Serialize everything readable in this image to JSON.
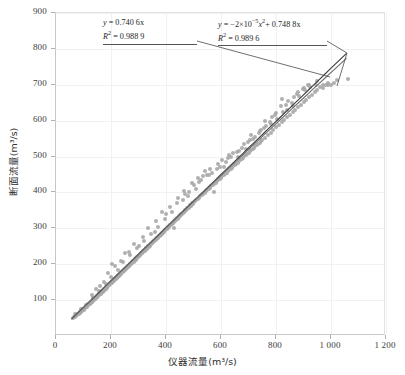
{
  "chart_data": {
    "type": "scatter",
    "title": "",
    "xlabel": "仪器流量(m³/s)",
    "ylabel": "断面流量(m³/s)",
    "xlim": [
      0,
      1200
    ],
    "ylim": [
      0,
      900
    ],
    "xticks": [
      0,
      200,
      400,
      600,
      800,
      1000,
      1200
    ],
    "xticklabels": [
      "0",
      "200",
      "400",
      "600",
      "800",
      "1 000",
      "1 200"
    ],
    "yticks": [
      100,
      200,
      300,
      400,
      500,
      600,
      700,
      800,
      900
    ],
    "yticklabels": [
      "100",
      "200",
      "300",
      "400",
      "500",
      "600",
      "700",
      "800",
      "900"
    ],
    "grid": true,
    "legend": "none",
    "point_color": "#a9a9a9",
    "line_color": "#3a3a3a",
    "annotations": [
      {
        "id": "linear-fit",
        "equation_prefix": "y",
        "equation_body": " = 0.740 6x",
        "r2_label": "R",
        "r2_sup": "2",
        "r2_value": " = 0.988 9"
      },
      {
        "id": "quadratic-fit",
        "equation_prefix": "y",
        "equation_body_a": " = −2×10",
        "equation_sup_a": "−5",
        "equation_body_b": "x",
        "equation_sup_b": "2",
        "equation_body_c": "+ 0.748 8x",
        "r2_label": "R",
        "r2_sup": "2",
        "r2_value": " = 0.989 6"
      }
    ],
    "fit_lines": [
      {
        "name": "linear",
        "slope": 0.7406,
        "intercept": 0,
        "r2": 0.9889,
        "x_range": [
          60,
          1060
        ]
      },
      {
        "name": "quadratic",
        "a": -2e-05,
        "b": 0.7488,
        "c": 0,
        "r2": 0.9896,
        "x_range": [
          60,
          1060
        ]
      }
    ],
    "points": [
      [
        62,
        50
      ],
      [
        66,
        52
      ],
      [
        68,
        55
      ],
      [
        70,
        54
      ],
      [
        72,
        58
      ],
      [
        74,
        57
      ],
      [
        76,
        60
      ],
      [
        78,
        59
      ],
      [
        80,
        62
      ],
      [
        82,
        61
      ],
      [
        84,
        64
      ],
      [
        86,
        66
      ],
      [
        88,
        65
      ],
      [
        90,
        68
      ],
      [
        92,
        70
      ],
      [
        94,
        69
      ],
      [
        96,
        72
      ],
      [
        98,
        74
      ],
      [
        100,
        73
      ],
      [
        102,
        76
      ],
      [
        104,
        78
      ],
      [
        106,
        77
      ],
      [
        108,
        80
      ],
      [
        110,
        82
      ],
      [
        112,
        81
      ],
      [
        114,
        84
      ],
      [
        116,
        86
      ],
      [
        118,
        85
      ],
      [
        120,
        88
      ],
      [
        122,
        90
      ],
      [
        124,
        89
      ],
      [
        126,
        92
      ],
      [
        128,
        94
      ],
      [
        130,
        96
      ],
      [
        132,
        95
      ],
      [
        134,
        98
      ],
      [
        136,
        100
      ],
      [
        138,
        99
      ],
      [
        140,
        102
      ],
      [
        142,
        104
      ],
      [
        144,
        106
      ],
      [
        146,
        105
      ],
      [
        148,
        108
      ],
      [
        150,
        110
      ],
      [
        152,
        112
      ],
      [
        154,
        111
      ],
      [
        156,
        114
      ],
      [
        158,
        116
      ],
      [
        160,
        118
      ],
      [
        162,
        117
      ],
      [
        164,
        120
      ],
      [
        166,
        122
      ],
      [
        168,
        124
      ],
      [
        170,
        123
      ],
      [
        172,
        126
      ],
      [
        174,
        128
      ],
      [
        176,
        130
      ],
      [
        178,
        129
      ],
      [
        180,
        132
      ],
      [
        182,
        134
      ],
      [
        184,
        136
      ],
      [
        186,
        135
      ],
      [
        188,
        138
      ],
      [
        190,
        140
      ],
      [
        192,
        142
      ],
      [
        194,
        141
      ],
      [
        196,
        144
      ],
      [
        198,
        146
      ],
      [
        200,
        148
      ],
      [
        202,
        147
      ],
      [
        204,
        150
      ],
      [
        206,
        152
      ],
      [
        208,
        154
      ],
      [
        210,
        153
      ],
      [
        212,
        156
      ],
      [
        214,
        158
      ],
      [
        216,
        160
      ],
      [
        218,
        159
      ],
      [
        220,
        162
      ],
      [
        222,
        164
      ],
      [
        224,
        166
      ],
      [
        226,
        165
      ],
      [
        228,
        168
      ],
      [
        230,
        170
      ],
      [
        232,
        172
      ],
      [
        234,
        171
      ],
      [
        236,
        174
      ],
      [
        238,
        176
      ],
      [
        240,
        178
      ],
      [
        242,
        177
      ],
      [
        244,
        180
      ],
      [
        246,
        182
      ],
      [
        248,
        184
      ],
      [
        250,
        183
      ],
      [
        252,
        186
      ],
      [
        254,
        188
      ],
      [
        256,
        190
      ],
      [
        258,
        189
      ],
      [
        260,
        192
      ],
      [
        262,
        194
      ],
      [
        264,
        196
      ],
      [
        266,
        195
      ],
      [
        268,
        198
      ],
      [
        270,
        200
      ],
      [
        272,
        202
      ],
      [
        274,
        201
      ],
      [
        276,
        204
      ],
      [
        278,
        206
      ],
      [
        280,
        208
      ],
      [
        282,
        207
      ],
      [
        284,
        210
      ],
      [
        286,
        212
      ],
      [
        288,
        214
      ],
      [
        290,
        213
      ],
      [
        292,
        216
      ],
      [
        294,
        218
      ],
      [
        296,
        220
      ],
      [
        298,
        219
      ],
      [
        300,
        222
      ],
      [
        302,
        224
      ],
      [
        304,
        226
      ],
      [
        306,
        225
      ],
      [
        308,
        228
      ],
      [
        310,
        230
      ],
      [
        312,
        232
      ],
      [
        314,
        231
      ],
      [
        316,
        234
      ],
      [
        318,
        236
      ],
      [
        320,
        238
      ],
      [
        322,
        237
      ],
      [
        324,
        240
      ],
      [
        326,
        242
      ],
      [
        328,
        244
      ],
      [
        330,
        243
      ],
      [
        332,
        246
      ],
      [
        334,
        248
      ],
      [
        336,
        250
      ],
      [
        338,
        249
      ],
      [
        340,
        252
      ],
      [
        342,
        254
      ],
      [
        344,
        256
      ],
      [
        346,
        255
      ],
      [
        348,
        258
      ],
      [
        350,
        260
      ],
      [
        352,
        262
      ],
      [
        354,
        261
      ],
      [
        356,
        264
      ],
      [
        358,
        266
      ],
      [
        360,
        268
      ],
      [
        362,
        267
      ],
      [
        364,
        270
      ],
      [
        366,
        272
      ],
      [
        368,
        274
      ],
      [
        370,
        273
      ],
      [
        372,
        276
      ],
      [
        374,
        278
      ],
      [
        376,
        280
      ],
      [
        378,
        279
      ],
      [
        380,
        282
      ],
      [
        382,
        284
      ],
      [
        384,
        286
      ],
      [
        386,
        285
      ],
      [
        388,
        288
      ],
      [
        390,
        290
      ],
      [
        392,
        292
      ],
      [
        394,
        291
      ],
      [
        396,
        294
      ],
      [
        398,
        296
      ],
      [
        400,
        298
      ],
      [
        402,
        297
      ],
      [
        404,
        300
      ],
      [
        406,
        302
      ],
      [
        408,
        304
      ],
      [
        410,
        303
      ],
      [
        412,
        306
      ],
      [
        414,
        308
      ],
      [
        416,
        310
      ],
      [
        418,
        309
      ],
      [
        420,
        312
      ],
      [
        422,
        314
      ],
      [
        424,
        316
      ],
      [
        426,
        315
      ],
      [
        428,
        318
      ],
      [
        430,
        320
      ],
      [
        432,
        322
      ],
      [
        434,
        321
      ],
      [
        436,
        324
      ],
      [
        438,
        326
      ],
      [
        440,
        328
      ],
      [
        442,
        327
      ],
      [
        444,
        330
      ],
      [
        446,
        332
      ],
      [
        448,
        334
      ],
      [
        450,
        333
      ],
      [
        452,
        336
      ],
      [
        454,
        338
      ],
      [
        456,
        340
      ],
      [
        458,
        339
      ],
      [
        460,
        342
      ],
      [
        462,
        344
      ],
      [
        464,
        346
      ],
      [
        466,
        345
      ],
      [
        468,
        348
      ],
      [
        470,
        350
      ],
      [
        472,
        352
      ],
      [
        474,
        351
      ],
      [
        476,
        354
      ],
      [
        478,
        356
      ],
      [
        480,
        358
      ],
      [
        482,
        357
      ],
      [
        484,
        360
      ],
      [
        486,
        362
      ],
      [
        488,
        364
      ],
      [
        490,
        363
      ],
      [
        492,
        366
      ],
      [
        494,
        368
      ],
      [
        496,
        370
      ],
      [
        498,
        369
      ],
      [
        500,
        372
      ],
      [
        505,
        375
      ],
      [
        510,
        378
      ],
      [
        515,
        382
      ],
      [
        520,
        385
      ],
      [
        525,
        389
      ],
      [
        530,
        392
      ],
      [
        535,
        396
      ],
      [
        540,
        399
      ],
      [
        545,
        403
      ],
      [
        550,
        406
      ],
      [
        555,
        410
      ],
      [
        560,
        413
      ],
      [
        565,
        417
      ],
      [
        570,
        420
      ],
      [
        575,
        424
      ],
      [
        580,
        427
      ],
      [
        585,
        431
      ],
      [
        590,
        434
      ],
      [
        595,
        438
      ],
      [
        600,
        441
      ],
      [
        605,
        445
      ],
      [
        610,
        448
      ],
      [
        615,
        452
      ],
      [
        620,
        455
      ],
      [
        625,
        459
      ],
      [
        630,
        462
      ],
      [
        635,
        466
      ],
      [
        640,
        469
      ],
      [
        645,
        473
      ],
      [
        650,
        476
      ],
      [
        655,
        480
      ],
      [
        660,
        483
      ],
      [
        665,
        487
      ],
      [
        670,
        490
      ],
      [
        675,
        494
      ],
      [
        680,
        497
      ],
      [
        685,
        501
      ],
      [
        690,
        504
      ],
      [
        695,
        508
      ],
      [
        700,
        511
      ],
      [
        705,
        515
      ],
      [
        710,
        518
      ],
      [
        715,
        522
      ],
      [
        720,
        525
      ],
      [
        725,
        529
      ],
      [
        730,
        532
      ],
      [
        735,
        536
      ],
      [
        740,
        539
      ],
      [
        745,
        543
      ],
      [
        750,
        546
      ],
      [
        760,
        553
      ],
      [
        770,
        560
      ],
      [
        780,
        567
      ],
      [
        790,
        574
      ],
      [
        800,
        581
      ],
      [
        810,
        588
      ],
      [
        820,
        595
      ],
      [
        830,
        602
      ],
      [
        840,
        609
      ],
      [
        850,
        616
      ],
      [
        860,
        623
      ],
      [
        870,
        630
      ],
      [
        880,
        637
      ],
      [
        890,
        644
      ],
      [
        900,
        651
      ],
      [
        910,
        658
      ],
      [
        920,
        665
      ],
      [
        930,
        672
      ],
      [
        940,
        679
      ],
      [
        950,
        686
      ],
      [
        960,
        693
      ],
      [
        970,
        700
      ],
      [
        980,
        700
      ],
      [
        990,
        705
      ],
      [
        1000,
        700
      ],
      [
        1010,
        705
      ],
      [
        1020,
        712
      ],
      [
        1060,
        715
      ],
      [
        160,
        140
      ],
      [
        205,
        200
      ],
      [
        250,
        230
      ],
      [
        300,
        250
      ],
      [
        360,
        290
      ],
      [
        400,
        340
      ],
      [
        430,
        300
      ],
      [
        470,
        395
      ],
      [
        500,
        420
      ],
      [
        520,
        430
      ],
      [
        540,
        460
      ],
      [
        560,
        465
      ],
      [
        575,
        400
      ],
      [
        590,
        480
      ],
      [
        610,
        470
      ],
      [
        630,
        505
      ],
      [
        660,
        500
      ],
      [
        690,
        520
      ],
      [
        710,
        560
      ],
      [
        740,
        570
      ],
      [
        760,
        600
      ],
      [
        780,
        590
      ],
      [
        800,
        620
      ],
      [
        820,
        660
      ],
      [
        840,
        630
      ],
      [
        860,
        640
      ],
      [
        880,
        680
      ],
      [
        900,
        690
      ],
      [
        920,
        700
      ],
      [
        950,
        710
      ],
      [
        970,
        690
      ],
      [
        990,
        700
      ],
      [
        115,
        90
      ],
      [
        130,
        115
      ],
      [
        145,
        130
      ],
      [
        175,
        150
      ],
      [
        190,
        175
      ],
      [
        215,
        195
      ],
      [
        235,
        210
      ],
      [
        265,
        235
      ],
      [
        285,
        255
      ],
      [
        315,
        275
      ],
      [
        335,
        300
      ],
      [
        365,
        320
      ],
      [
        385,
        345
      ],
      [
        415,
        360
      ],
      [
        445,
        385
      ],
      [
        465,
        405
      ],
      [
        485,
        400
      ],
      [
        495,
        425
      ],
      [
        515,
        440
      ],
      [
        535,
        445
      ],
      [
        555,
        450
      ],
      [
        585,
        465
      ],
      [
        605,
        490
      ],
      [
        625,
        495
      ],
      [
        645,
        510
      ],
      [
        665,
        515
      ],
      [
        685,
        535
      ],
      [
        705,
        545
      ],
      [
        725,
        555
      ],
      [
        745,
        575
      ],
      [
        765,
        585
      ],
      [
        785,
        610
      ],
      [
        805,
        605
      ],
      [
        825,
        625
      ],
      [
        845,
        655
      ],
      [
        865,
        665
      ],
      [
        885,
        670
      ],
      [
        905,
        685
      ],
      [
        925,
        695
      ],
      [
        945,
        700
      ],
      [
        70,
        60
      ],
      [
        90,
        75
      ],
      [
        110,
        85
      ],
      [
        135,
        105
      ],
      [
        155,
        125
      ],
      [
        180,
        145
      ],
      [
        200,
        165
      ],
      [
        225,
        185
      ],
      [
        245,
        205
      ],
      [
        270,
        225
      ],
      [
        295,
        245
      ],
      [
        320,
        265
      ],
      [
        345,
        285
      ],
      [
        370,
        305
      ],
      [
        395,
        325
      ],
      [
        420,
        345
      ],
      [
        440,
        370
      ],
      [
        460,
        380
      ],
      [
        480,
        390
      ],
      [
        508,
        410
      ],
      [
        528,
        435
      ],
      [
        548,
        448
      ],
      [
        568,
        455
      ],
      [
        598,
        470
      ],
      [
        618,
        485
      ],
      [
        638,
        500
      ],
      [
        658,
        512
      ],
      [
        678,
        525
      ],
      [
        698,
        540
      ],
      [
        718,
        550
      ],
      [
        738,
        565
      ],
      [
        758,
        580
      ],
      [
        778,
        595
      ],
      [
        798,
        615
      ],
      [
        818,
        640
      ],
      [
        838,
        645
      ],
      [
        858,
        650
      ],
      [
        878,
        675
      ],
      [
        898,
        688
      ],
      [
        918,
        698
      ]
    ]
  }
}
